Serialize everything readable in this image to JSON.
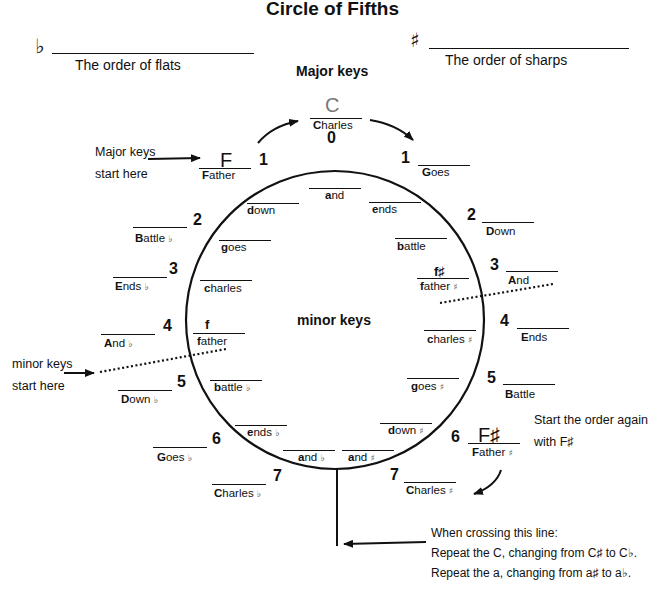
{
  "title": "Circle of Fifths",
  "header": {
    "flats": {
      "symbol": "♭",
      "label": "The order of flats"
    },
    "sharps": {
      "symbol": "♯",
      "label": "The order of sharps"
    }
  },
  "sections": {
    "major": "Major keys",
    "minor": "minor keys"
  },
  "notes": {
    "major_start": [
      "Major keys",
      "start here"
    ],
    "minor_start": [
      "minor keys",
      "start here"
    ],
    "restart": [
      "Start the order again",
      "with F♯"
    ],
    "crossing": [
      "When crossing this line:",
      "Repeat the C, changing from C♯ to C♭.",
      "Repeat the a, changing from a♯ to a♭."
    ]
  },
  "top_key": {
    "letter": "C",
    "word": "Charles",
    "count": "0"
  },
  "major_flat": [
    {
      "count": "1",
      "letter": "F",
      "word": "Father",
      "acc": ""
    },
    {
      "count": "2",
      "letter": "",
      "word": "Battle",
      "acc": "♭"
    },
    {
      "count": "3",
      "letter": "",
      "word": "Ends",
      "acc": "♭"
    },
    {
      "count": "4",
      "letter": "",
      "word": "And",
      "acc": "♭"
    },
    {
      "count": "5",
      "letter": "",
      "word": "Down",
      "acc": "♭"
    },
    {
      "count": "6",
      "letter": "",
      "word": "Goes",
      "acc": "♭"
    },
    {
      "count": "7",
      "letter": "",
      "word": "Charles",
      "acc": "♭"
    }
  ],
  "major_sharp": [
    {
      "count": "1",
      "letter": "",
      "word": "Goes",
      "acc": ""
    },
    {
      "count": "2",
      "letter": "",
      "word": "Down",
      "acc": ""
    },
    {
      "count": "3",
      "letter": "",
      "word": "And",
      "acc": ""
    },
    {
      "count": "4",
      "letter": "",
      "word": "Ends",
      "acc": ""
    },
    {
      "count": "5",
      "letter": "",
      "word": "Battle",
      "acc": ""
    },
    {
      "count": "6",
      "letter": "F♯",
      "word": "Father",
      "acc": "♯"
    },
    {
      "count": "7",
      "letter": "",
      "word": "Charles",
      "acc": "♯"
    }
  ],
  "minor_flat": [
    {
      "letter": "",
      "word": "down",
      "acc": ""
    },
    {
      "letter": "",
      "word": "goes",
      "acc": ""
    },
    {
      "letter": "",
      "word": "charles",
      "acc": ""
    },
    {
      "letter": "f",
      "word": "father",
      "acc": ""
    },
    {
      "letter": "",
      "word": "battle",
      "acc": "♭"
    },
    {
      "letter": "",
      "word": "ends",
      "acc": "♭"
    },
    {
      "letter": "",
      "word": "and",
      "acc": "♭"
    }
  ],
  "minor_top": {
    "word": "and"
  },
  "minor_sharp": [
    {
      "letter": "",
      "word": "ends",
      "acc": ""
    },
    {
      "letter": "",
      "word": "battle",
      "acc": ""
    },
    {
      "letter": "f♯",
      "word": "father",
      "acc": "♯"
    },
    {
      "letter": "",
      "word": "charles",
      "acc": "♯"
    },
    {
      "letter": "",
      "word": "goes",
      "acc": "♯"
    },
    {
      "letter": "",
      "word": "down",
      "acc": "♯"
    },
    {
      "letter": "",
      "word": "and",
      "acc": "♯"
    }
  ],
  "colors": {
    "ink": "#111111",
    "gray_letter": "#777777",
    "background": "#ffffff"
  }
}
